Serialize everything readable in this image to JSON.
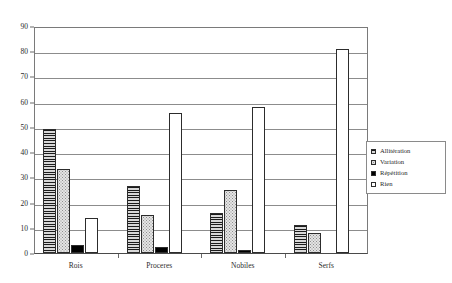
{
  "chart_data": {
    "type": "bar",
    "title": "",
    "subtitle": "",
    "xlabel": "",
    "ylabel": "(%)",
    "ylim": [
      0,
      90
    ],
    "ytick_step": 10,
    "yticks": [
      "0",
      "10",
      "20",
      "30",
      "40",
      "50",
      "60",
      "70",
      "80",
      "90"
    ],
    "grid": true,
    "legend_position": "right",
    "categories": [
      "Rois",
      "Proceres",
      "Nobiles",
      "Serfs"
    ],
    "series": [
      {
        "name": "Allitération",
        "pattern": "dark-horizontal-stripes",
        "values": [
          49,
          26.5,
          16,
          11
        ]
      },
      {
        "name": "Variation",
        "pattern": "light-stipple",
        "values": [
          33.5,
          15,
          25,
          8
        ]
      },
      {
        "name": "Répétition",
        "pattern": "solid-black",
        "values": [
          3,
          2.5,
          1,
          0
        ]
      },
      {
        "name": "Rien",
        "pattern": "white-empty",
        "values": [
          14,
          55.5,
          58,
          81
        ]
      }
    ]
  },
  "axis": {
    "unit_label": "(%)"
  },
  "legend": {
    "items": [
      {
        "label": "Allitération"
      },
      {
        "label": "Variation"
      },
      {
        "label": "Répétition"
      },
      {
        "label": "Rien"
      }
    ]
  },
  "colors": {
    "frame": "#7a7a7a",
    "gridline": "#8c8c8c",
    "bar_outline": "#2c2c2c",
    "text": "#2b2b2b",
    "background": "#ffffff"
  }
}
